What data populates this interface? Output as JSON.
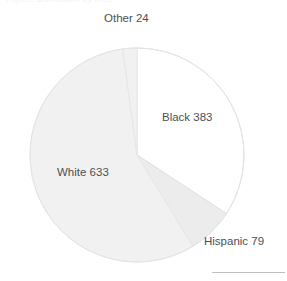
{
  "page": {
    "background_color": "#ffffff",
    "cropped_title_fragment": "Figure: distribution by race"
  },
  "chart_data": {
    "type": "pie",
    "title": "",
    "subtitle": "",
    "xlabel": "",
    "ylabel": "",
    "grid": false,
    "legend_position": "none",
    "label_format": "{name} {value}",
    "start_angle_deg": 0,
    "direction": "clockwise",
    "total": 1119,
    "categories": [
      "Black",
      "Hispanic",
      "White",
      "Other"
    ],
    "values": [
      383,
      79,
      633,
      24
    ],
    "slices": [
      {
        "name": "Black",
        "value": 383,
        "label": "Black 383",
        "percent": 34.2,
        "angle_deg": 123.2,
        "start_deg": 0,
        "end_deg": 123.2,
        "color": "#ffffff",
        "stroke": "#e2e2e4"
      },
      {
        "name": "Hispanic",
        "value": 79,
        "label": "Hispanic 79",
        "percent": 7.1,
        "angle_deg": 25.4,
        "start_deg": 123.2,
        "end_deg": 148.6,
        "color": "#ececed",
        "stroke": "#e2e2e4"
      },
      {
        "name": "White",
        "value": 633,
        "label": "White 633",
        "percent": 56.6,
        "angle_deg": 203.7,
        "start_deg": 148.6,
        "end_deg": 352.3,
        "color": "#f1f1f2",
        "stroke": "#e7e7e9"
      },
      {
        "name": "Other",
        "value": 24,
        "label": "Other 24",
        "percent": 2.1,
        "angle_deg": 7.7,
        "start_deg": 352.3,
        "end_deg": 360,
        "color": "#f1f1f2",
        "stroke": "#e7e7e9"
      }
    ],
    "geometry": {
      "center_x": 137,
      "center_y": 155,
      "radius": 107
    },
    "annotations": {
      "bottom_rule_color": "#bfbfc2"
    }
  }
}
